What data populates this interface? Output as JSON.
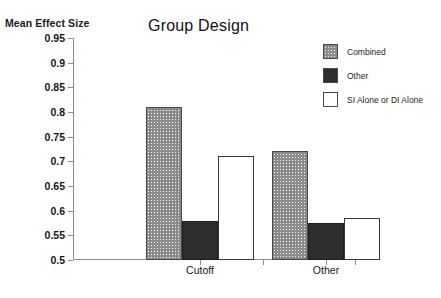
{
  "chart_data": {
    "type": "bar",
    "title": "Group Design",
    "xlabel": "",
    "ylabel": "Mean Effect Size",
    "categories": [
      "Cutoff",
      "Other"
    ],
    "series": [
      {
        "name": "Combined",
        "values": [
          0.81,
          0.72
        ],
        "fill": "hatch"
      },
      {
        "name": "Other",
        "values": [
          0.58,
          0.575
        ],
        "fill": "dark"
      },
      {
        "name": "SI Alone or DI Alone",
        "values": [
          0.71,
          0.585
        ],
        "fill": "white"
      }
    ],
    "ylim": [
      0.5,
      0.95
    ],
    "yticks": [
      0.5,
      0.55,
      0.6,
      0.65,
      0.7,
      0.75,
      0.8,
      0.85,
      0.9,
      0.95
    ],
    "ytick_labels": [
      "0.5",
      "0.55",
      "0.6",
      "0.65",
      "0.7",
      "0.75",
      "0.8",
      "0.85",
      "0.9",
      "0.95"
    ],
    "grid": false,
    "legend_position": "top-right",
    "colors": {
      "hatch_line": "#8a8a8a",
      "dark": "#2e2e2e",
      "white": "#ffffff",
      "axis": "#8d8d8d",
      "text": "#161616"
    }
  }
}
